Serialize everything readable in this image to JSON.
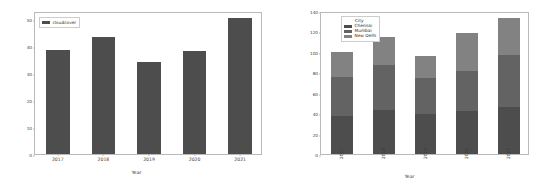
{
  "figure": {
    "background": "#ffffff",
    "panels": [
      "left-cloudcover-bar",
      "right-city-stacked-bar"
    ]
  },
  "chart_data": [
    {
      "type": "bar",
      "title": "",
      "xlabel": "Year",
      "ylabel": "",
      "categories": [
        "2017",
        "2018",
        "2019",
        "2020",
        "2021"
      ],
      "values": [
        38.5,
        43.5,
        34.0,
        38.0,
        50.5
      ],
      "series": [
        {
          "name": "cloudcover",
          "values": [
            38.5,
            43.5,
            34.0,
            38.0,
            50.5
          ],
          "color": "#4d4d4d"
        }
      ],
      "legend": {
        "position": "upper-left",
        "title": "",
        "entries": [
          "cloudcover"
        ]
      },
      "yticks": [
        0,
        10,
        20,
        30,
        40,
        50
      ],
      "ylim": [
        0,
        53
      ],
      "xticklabels": [
        "2017",
        "2018",
        "2019",
        "2020",
        "2021"
      ],
      "grid": false
    },
    {
      "type": "bar",
      "subtype": "stacked",
      "title": "",
      "xlabel": "Year",
      "ylabel": "",
      "categories": [
        "2017",
        "2018",
        "2019",
        "2020",
        "2021"
      ],
      "series": [
        {
          "name": "Chennai",
          "values": [
            37,
            43,
            39,
            42,
            46
          ],
          "color": "#4d4d4d"
        },
        {
          "name": "Mumbai",
          "values": [
            38,
            44,
            35,
            39,
            51
          ],
          "color": "#636363"
        },
        {
          "name": "New Delhi",
          "values": [
            25,
            28,
            22,
            37,
            36
          ],
          "color": "#828282"
        }
      ],
      "totals": [
        100,
        115,
        96,
        118,
        133
      ],
      "legend": {
        "position": "upper-left",
        "title": "City",
        "entries": [
          "Chennai",
          "Mumbai",
          "New Delhi"
        ]
      },
      "yticks": [
        0,
        20,
        40,
        60,
        80,
        100,
        120,
        140
      ],
      "ylim": [
        0,
        140
      ],
      "xticklabels": [
        "2017",
        "2018",
        "2019",
        "2020",
        "2021"
      ],
      "xticklabel_rotation": -90,
      "grid": false
    }
  ]
}
